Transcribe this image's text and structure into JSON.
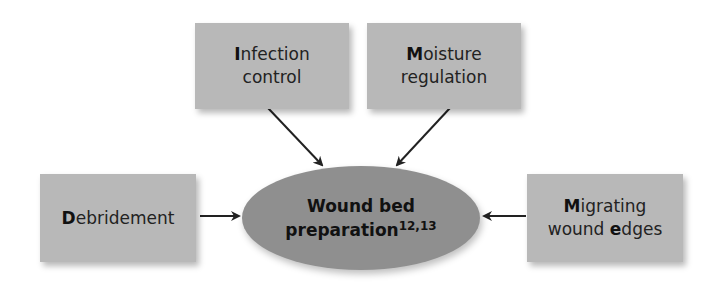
{
  "diagram": {
    "center": {
      "line1": "Wound bed",
      "line2": "preparation",
      "superscript": "12,13",
      "fill_color": "#8f8f8f"
    },
    "nodes": [
      {
        "id": "infection-control",
        "initial": "I",
        "line1_rest": "nfection",
        "line2": "control",
        "full_label": "Infection control"
      },
      {
        "id": "moisture-regulation",
        "initial": "M",
        "line1_rest": "oisture",
        "line2": "regulation",
        "full_label": "Moisture regulation"
      },
      {
        "id": "debridement",
        "initial": "D",
        "line1_rest": "ebridement",
        "full_label": "Debridement"
      },
      {
        "id": "migrating-wound-edges",
        "initial": "M",
        "line1_rest": "igrating",
        "line2_pre": "wound ",
        "line2_initial": "e",
        "line2_rest": "dges",
        "full_label": "Migrating wound edges"
      }
    ],
    "edges": [
      {
        "from": "infection-control",
        "to": "center"
      },
      {
        "from": "moisture-regulation",
        "to": "center"
      },
      {
        "from": "debridement",
        "to": "center"
      },
      {
        "from": "migrating-wound-edges",
        "to": "center"
      }
    ],
    "colors": {
      "box_fill": "#b8b8b8",
      "arrow": "#222222",
      "background": "#ffffff"
    }
  }
}
